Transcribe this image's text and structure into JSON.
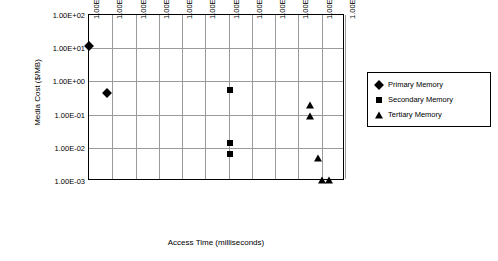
{
  "chart_data": {
    "type": "scatter",
    "title": "",
    "xlabel": "Access Time (milliseconds)",
    "ylabel": "Media Cost ($/MB)",
    "xscale": "log",
    "yscale": "log",
    "xlim": [
      1e-05,
      1000000.0
    ],
    "ylim": [
      0.001,
      100.0
    ],
    "grid": true,
    "legend_position": "right",
    "xticks": [
      "1.00E-05",
      "1.00E-04",
      "1.00E-03",
      "1.00E-02",
      "1.00E-01",
      "1.00E+00",
      "1.00E+01",
      "1.00E+02",
      "1.00E+03",
      "1.00E+04",
      "1.00E+05",
      "1.00E+06"
    ],
    "yticks": [
      "1.00E-03",
      "1.00E-02",
      "1.00E-01",
      "1.00E+00",
      "1.00E+01",
      "1.00E+02"
    ],
    "series": [
      {
        "name": "Primary Memory",
        "marker": "diamond",
        "color": "#000000",
        "points": [
          {
            "x": 1e-05,
            "y": 12.0
          },
          {
            "x": 6e-05,
            "y": 0.45
          }
        ]
      },
      {
        "name": "Secondary Memory",
        "marker": "square",
        "color": "#000000",
        "points": [
          {
            "x": 12.0,
            "y": 0.55
          },
          {
            "x": 11.0,
            "y": 0.014
          },
          {
            "x": 12.0,
            "y": 0.0065
          }
        ]
      },
      {
        "name": "Tertiary Memory",
        "marker": "triangle",
        "color": "#000000",
        "points": [
          {
            "x": 32000.0,
            "y": 0.2
          },
          {
            "x": 32000.0,
            "y": 0.09
          },
          {
            "x": 70000.0,
            "y": 0.005
          },
          {
            "x": 100000.0,
            "y": 0.0011
          },
          {
            "x": 200000.0,
            "y": 0.0011
          }
        ]
      }
    ]
  }
}
